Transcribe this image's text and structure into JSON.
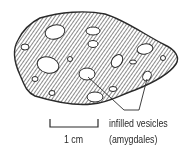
{
  "figure": {
    "labels": {
      "annotation_line1": "infilled vesicles",
      "annotation_line2": "(amygdales)",
      "scale_bar": "1 cm"
    },
    "colors": {
      "ink": "#2a2a2a",
      "background": "#ffffff"
    }
  }
}
